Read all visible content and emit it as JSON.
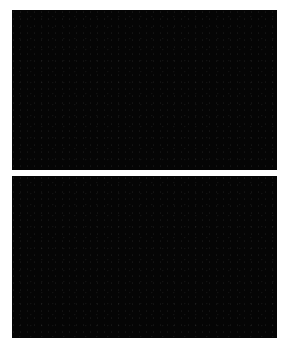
{
  "figure": {
    "panels": [
      {
        "id": "top",
        "description": "Star field with a bright object near center and a second bright star at upper left",
        "bright_objects": [
          {
            "x": 138,
            "y": 76,
            "size": 12,
            "kind": "bright-object"
          },
          {
            "x": 29,
            "y": 27,
            "size": 6,
            "kind": "bright-star"
          }
        ]
      },
      {
        "id": "bottom",
        "description": "Same star field; bright central object absent, faint streak near center, bright star at upper left",
        "bright_objects": [
          {
            "x": 29,
            "y": 41,
            "size": 6,
            "kind": "bright-star"
          },
          {
            "x": 144,
            "y": 90,
            "size": 8,
            "kind": "streak"
          }
        ]
      }
    ],
    "colors": {
      "background": "#ffffff",
      "sky": "#050505",
      "star": "#f2f2f2"
    }
  }
}
